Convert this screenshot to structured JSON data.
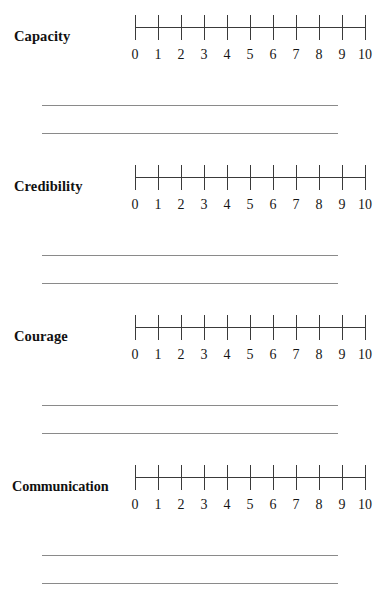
{
  "document": {
    "title": "Leadership Rating Scale Worksheet",
    "background_color": "#ffffff",
    "line_color": "#8a8a8a",
    "axis_color": "#3a3a3a",
    "text_color": "#111111"
  },
  "scale": {
    "min": 0,
    "max": 10,
    "step": 1,
    "tick_labels": [
      "0",
      "1",
      "2",
      "3",
      "4",
      "5",
      "6",
      "7",
      "8",
      "9",
      "10"
    ],
    "tick_count": 11
  },
  "sections": [
    {
      "id": "capacity",
      "label": "Capacity",
      "selected_value": null,
      "response_lines": 2
    },
    {
      "id": "credibility",
      "label": "Credibility",
      "selected_value": null,
      "response_lines": 2
    },
    {
      "id": "courage",
      "label": "Courage",
      "selected_value": null,
      "response_lines": 2
    },
    {
      "id": "communication",
      "label": "Communication",
      "selected_value": null,
      "response_lines": 2
    }
  ]
}
